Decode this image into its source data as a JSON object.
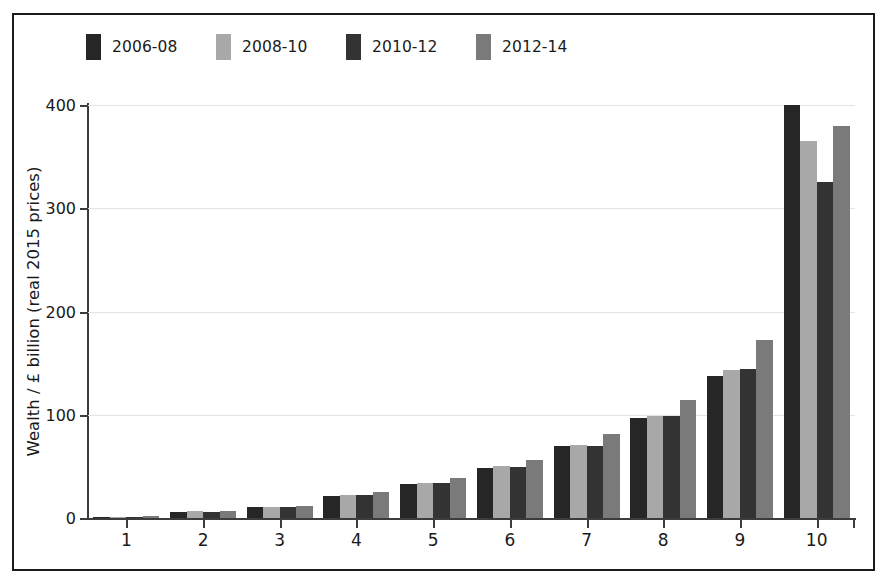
{
  "figure": {
    "background": "#ffffff",
    "border_color": "#1a1a1a",
    "gridline_color": "#e3e3e3",
    "axis_color": "#3c3c3c"
  },
  "chart_data": {
    "type": "bar",
    "title": "",
    "xlabel": "",
    "ylabel": "Wealth / £ billion (real 2015 prices)",
    "categories": [
      "1",
      "2",
      "3",
      "4",
      "5",
      "6",
      "7",
      "8",
      "9",
      "10"
    ],
    "ylim": [
      0,
      400
    ],
    "yticks": [
      0,
      100,
      200,
      300,
      400
    ],
    "ytick_labels": [
      "0",
      "100",
      "200",
      "300",
      "400"
    ],
    "grid": true,
    "legend_position": "top-left",
    "series": [
      {
        "name": "2006-08",
        "color": "#262626",
        "values": [
          1,
          6,
          11,
          21,
          33,
          48,
          70,
          97,
          138,
          400
        ]
      },
      {
        "name": "2008-10",
        "color": "#a8a8a8",
        "values": [
          1,
          7,
          11,
          22,
          34,
          50,
          71,
          99,
          143,
          365
        ]
      },
      {
        "name": "2010-12",
        "color": "#333333",
        "values": [
          1,
          6,
          11,
          22,
          34,
          49,
          70,
          99,
          144,
          325
        ]
      },
      {
        "name": "2012-14",
        "color": "#7a7a7a",
        "values": [
          2,
          7,
          12,
          25,
          39,
          56,
          81,
          114,
          172,
          380
        ]
      }
    ]
  },
  "legend": {
    "entries": [
      {
        "label": "2006-08",
        "color": "#262626"
      },
      {
        "label": "2008-10",
        "color": "#a8a8a8"
      },
      {
        "label": "2010-12",
        "color": "#333333"
      },
      {
        "label": "2012-14",
        "color": "#7a7a7a"
      }
    ]
  }
}
